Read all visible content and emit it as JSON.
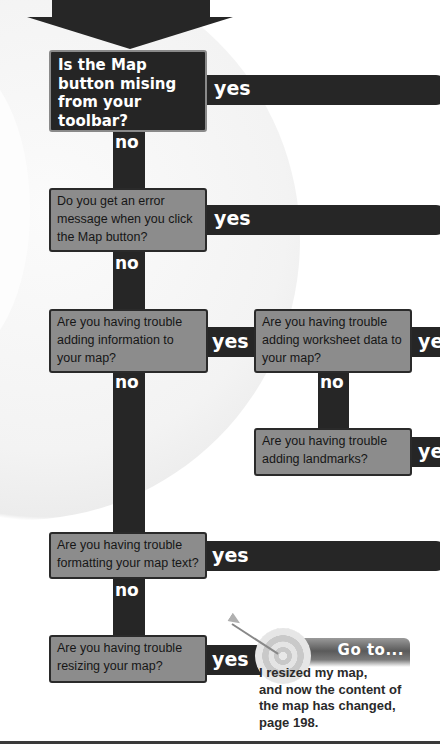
{
  "flowchart": {
    "title_arrow": "down-arrow",
    "colors": {
      "connector": "#262626",
      "question_box_fill": "#8c8c8c",
      "first_question_fill": "#252525",
      "label_text": "#ffffff"
    },
    "questions": [
      {
        "id": "q1",
        "text": "Is the Map button mising from your toolbar?",
        "lines": [
          "Is the Map",
          "button mising",
          "from your",
          "toolbar?"
        ]
      },
      {
        "id": "q2",
        "text": "Do you get an error message when you click the Map button?",
        "lines": [
          "Do you get an error",
          "message when you click",
          "the Map button?"
        ]
      },
      {
        "id": "q3",
        "text": "Are you having trouble adding information to your map?",
        "lines": [
          "Are you having trouble",
          "adding information to",
          "your map?"
        ]
      },
      {
        "id": "q4",
        "text": "Are you having trouble adding worksheet data to your map?",
        "lines": [
          "Are you having trouble",
          "adding worksheet data to",
          "your map?"
        ]
      },
      {
        "id": "q5",
        "text": "Are you having trouble adding landmarks?",
        "lines": [
          "Are you having trouble",
          "adding landmarks?"
        ]
      },
      {
        "id": "q6",
        "text": "Are you having trouble formatting your map text?",
        "lines": [
          "Are you having trouble",
          "formatting your map text?"
        ]
      },
      {
        "id": "q7",
        "text": "Are you having trouble resizing your map?",
        "lines": [
          "Are you having trouble",
          "resizing your map?"
        ]
      }
    ],
    "labels": {
      "yes": "yes",
      "no": "no",
      "yes_cropped": "ye"
    },
    "goto": {
      "title": "Go to...",
      "lines": [
        "I resized my map,",
        "and now the content of",
        "the map has changed,",
        "page 198."
      ]
    }
  }
}
